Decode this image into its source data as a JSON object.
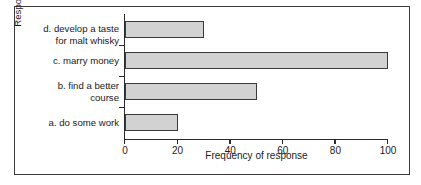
{
  "chart_data": {
    "type": "bar",
    "orientation": "horizontal",
    "title": "",
    "xlabel": "Frequency of response",
    "ylabel": "Response",
    "categories": [
      "a. do some work",
      "b. find a better\ncourse",
      "c. marry money",
      "d. develop a taste\nfor malt whisky"
    ],
    "values": [
      20,
      50,
      100,
      30
    ],
    "xlim": [
      0,
      100
    ],
    "xticks": [
      0,
      20,
      40,
      60,
      80,
      100
    ],
    "xticklabels": [
      "0",
      "20",
      "40",
      "60",
      "80",
      "100"
    ],
    "grid": false,
    "legend": false,
    "bar_fill_color": "#d2d2d2",
    "bar_edge_color": "#3a3a3a",
    "axis_color": "#2b2b2b",
    "frame_color": "#3b3b3b",
    "background_color": "#ffffff"
  }
}
